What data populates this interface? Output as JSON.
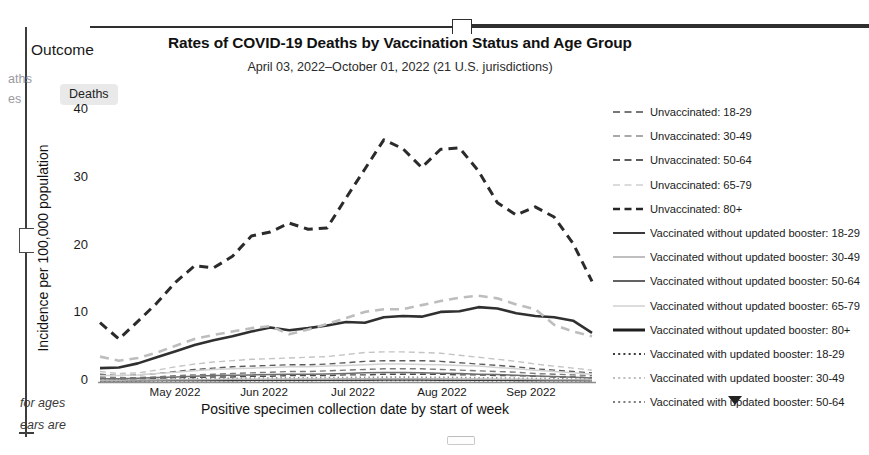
{
  "document": {
    "outcome_label": "Outcome",
    "gutter_fragment_1": "aths",
    "gutter_fragment_2": "es",
    "footnote_fragment_1": "for ages",
    "footnote_fragment_2": "ears are",
    "outcome_chip": "Deaths"
  },
  "chart_data": {
    "type": "line",
    "title": "Rates of COVID-19 Deaths by Vaccination Status and Age Group",
    "subtitle": "April 03, 2022–October 01, 2022 (21 U.S. jurisdictions)",
    "xlabel": "Positive specimen collection date by start of week",
    "ylabel": "Incidence per 100,000 population",
    "ylim": [
      0,
      40
    ],
    "yticks": [
      0,
      10,
      20,
      30,
      40
    ],
    "xticks": [
      "May 2022",
      "Jun 2022",
      "Jul 2022",
      "Aug 2022",
      "Sep 2022"
    ],
    "grid": false,
    "legend_position": "right",
    "x": [
      "2022-04-03",
      "2022-04-10",
      "2022-04-17",
      "2022-04-24",
      "2022-05-01",
      "2022-05-08",
      "2022-05-15",
      "2022-05-22",
      "2022-05-29",
      "2022-06-05",
      "2022-06-12",
      "2022-06-19",
      "2022-06-26",
      "2022-07-03",
      "2022-07-10",
      "2022-07-17",
      "2022-07-24",
      "2022-07-31",
      "2022-08-07",
      "2022-08-14",
      "2022-08-21",
      "2022-08-28",
      "2022-09-04",
      "2022-09-11",
      "2022-09-18",
      "2022-09-25",
      "2022-10-01"
    ],
    "series": [
      {
        "name": "Unvaccinated: 18-29",
        "style": "dashed",
        "color": "#4a4a4a",
        "width": 1.4,
        "values": [
          0.4,
          0.3,
          0.3,
          0.4,
          0.5,
          0.5,
          0.6,
          0.6,
          0.7,
          0.7,
          0.8,
          0.8,
          0.8,
          0.9,
          0.9,
          1.0,
          1.0,
          1.0,
          1.0,
          0.9,
          0.9,
          0.8,
          0.8,
          0.7,
          0.6,
          0.6,
          0.5
        ]
      },
      {
        "name": "Unvaccinated: 30-49",
        "style": "dashed",
        "color": "#7a7a7a",
        "width": 1.4,
        "values": [
          0.6,
          0.5,
          0.5,
          0.6,
          0.8,
          0.9,
          1.0,
          1.1,
          1.2,
          1.3,
          1.4,
          1.4,
          1.5,
          1.6,
          1.7,
          1.8,
          1.8,
          1.8,
          1.7,
          1.6,
          1.5,
          1.4,
          1.3,
          1.1,
          1.0,
          0.9,
          0.8
        ]
      },
      {
        "name": "Unvaccinated: 50-64",
        "style": "dashed",
        "color": "#5c5c5c",
        "width": 1.4,
        "values": [
          1.0,
          0.8,
          0.9,
          1.1,
          1.4,
          1.7,
          1.9,
          2.1,
          2.2,
          2.3,
          2.4,
          2.4,
          2.5,
          2.7,
          2.9,
          3.0,
          3.0,
          3.0,
          2.9,
          2.7,
          2.5,
          2.3,
          2.1,
          1.8,
          1.6,
          1.4,
          1.2
        ]
      },
      {
        "name": "Unvaccinated: 65-79",
        "style": "dashed",
        "color": "#c4c4c4",
        "width": 1.4,
        "values": [
          1.4,
          1.1,
          1.2,
          1.6,
          2.1,
          2.5,
          2.8,
          3.0,
          3.2,
          3.3,
          3.4,
          3.5,
          3.6,
          3.9,
          4.2,
          4.3,
          4.3,
          4.2,
          4.1,
          3.8,
          3.5,
          3.2,
          2.9,
          2.5,
          2.2,
          1.9,
          1.6
        ]
      },
      {
        "name": "Unvaccinated: 80+",
        "style": "dashed",
        "color": "#2b2b2b",
        "width": 3.0,
        "values": [
          8.6,
          6.2,
          8.8,
          11.5,
          14.6,
          17.0,
          16.7,
          18.4,
          21.4,
          22.0,
          23.3,
          22.4,
          22.6,
          27.0,
          31.3,
          35.6,
          34.3,
          31.5,
          34.2,
          34.4,
          31.0,
          26.3,
          24.5,
          25.7,
          24.2,
          20.3,
          14.7
        ]
      },
      {
        "name": "Vaccinated without updated booster: 18-29",
        "style": "solid",
        "color": "#3b3b3b",
        "width": 1.5,
        "values": [
          0.05,
          0.05,
          0.05,
          0.06,
          0.07,
          0.08,
          0.08,
          0.09,
          0.1,
          0.1,
          0.1,
          0.1,
          0.11,
          0.12,
          0.12,
          0.13,
          0.13,
          0.13,
          0.12,
          0.11,
          0.1,
          0.1,
          0.09,
          0.08,
          0.07,
          0.06,
          0.05
        ]
      },
      {
        "name": "Vaccinated without updated booster: 30-49",
        "style": "solid",
        "color": "#b5b5b5",
        "width": 1.5,
        "values": [
          0.12,
          0.12,
          0.13,
          0.15,
          0.18,
          0.2,
          0.22,
          0.24,
          0.26,
          0.27,
          0.28,
          0.29,
          0.3,
          0.32,
          0.34,
          0.35,
          0.35,
          0.34,
          0.33,
          0.31,
          0.29,
          0.27,
          0.25,
          0.22,
          0.2,
          0.18,
          0.15
        ]
      },
      {
        "name": "Vaccinated without updated booster: 50-64",
        "style": "solid",
        "color": "#6e6e6e",
        "width": 1.5,
        "values": [
          0.35,
          0.35,
          0.4,
          0.5,
          0.6,
          0.7,
          0.8,
          0.85,
          0.9,
          0.95,
          1.0,
          1.0,
          1.05,
          1.1,
          1.2,
          1.25,
          1.25,
          1.2,
          1.15,
          1.1,
          1.0,
          0.95,
          0.85,
          0.75,
          0.65,
          0.55,
          0.45
        ]
      },
      {
        "name": "Vaccinated without updated booster: 65-79",
        "style": "solid",
        "color": "#d2d2d2",
        "width": 1.5,
        "values": [
          0.8,
          0.8,
          0.9,
          1.1,
          1.3,
          1.5,
          1.7,
          1.8,
          1.9,
          2.0,
          2.1,
          2.1,
          2.2,
          2.3,
          2.4,
          2.5,
          2.5,
          2.45,
          2.4,
          2.3,
          2.2,
          2.0,
          1.8,
          1.6,
          1.4,
          1.2,
          1.0
        ]
      },
      {
        "name": "Vaccinated without updated booster: 80+",
        "style": "solid",
        "color": "#303030",
        "width": 2.6,
        "values": [
          1.9,
          2.0,
          2.6,
          3.5,
          4.4,
          5.3,
          6.0,
          6.6,
          7.3,
          7.9,
          7.5,
          7.8,
          8.2,
          8.7,
          8.6,
          9.4,
          9.6,
          9.5,
          10.2,
          10.3,
          10.9,
          10.7,
          10.0,
          9.6,
          9.4,
          8.9,
          7.1
        ]
      },
      {
        "name": "Vaccinated with updated booster: 18-29",
        "style": "dotted",
        "color": "#3b3b3b",
        "width": 1.6,
        "values": [
          0.03,
          0.03,
          0.03,
          0.04,
          0.04,
          0.05,
          0.05,
          0.05,
          0.06,
          0.06,
          0.06,
          0.06,
          0.07,
          0.07,
          0.07,
          0.08,
          0.08,
          0.08,
          0.07,
          0.07,
          0.06,
          0.06,
          0.05,
          0.05,
          0.04,
          0.04,
          0.03
        ]
      },
      {
        "name": "Vaccinated with updated booster: 30-49",
        "style": "dotted",
        "color": "#c0c0c0",
        "width": 1.6,
        "values": [
          0.08,
          0.08,
          0.09,
          0.1,
          0.11,
          0.12,
          0.13,
          0.14,
          0.15,
          0.16,
          0.16,
          0.17,
          0.17,
          0.18,
          0.19,
          0.19,
          0.19,
          0.19,
          0.18,
          0.17,
          0.16,
          0.15,
          0.14,
          0.12,
          0.11,
          0.1,
          0.08
        ]
      },
      {
        "name": "Vaccinated with updated booster: 50-64",
        "style": "dotted",
        "color": "#8a8a8a",
        "width": 1.6,
        "values": [
          0.2,
          0.2,
          0.22,
          0.26,
          0.3,
          0.34,
          0.38,
          0.4,
          0.43,
          0.45,
          0.47,
          0.48,
          0.5,
          0.52,
          0.55,
          0.57,
          0.57,
          0.56,
          0.54,
          0.52,
          0.49,
          0.46,
          0.42,
          0.38,
          0.34,
          0.3,
          0.25
        ]
      }
    ],
    "unvaccinated_80plus_dashed_overlay": {
      "name": "Unvaccinated: 65-79 (dashed, light) upper band",
      "style": "dashed",
      "color": "#bdbdbd",
      "width": 2.6,
      "values": [
        3.6,
        3.0,
        3.4,
        4.2,
        5.2,
        6.2,
        6.8,
        7.3,
        7.8,
        8.1,
        6.9,
        7.6,
        8.4,
        9.3,
        10.2,
        10.6,
        10.6,
        11.2,
        11.8,
        12.3,
        12.6,
        12.2,
        11.3,
        10.6,
        8.3,
        7.3,
        6.6
      ]
    }
  },
  "legend": {
    "more_icon": "chevron-down-icon",
    "entries": [
      {
        "label": "Unvaccinated: 18-29",
        "style": "dashed",
        "color": "#4a4a4a",
        "width": 1.6
      },
      {
        "label": "Unvaccinated: 30-49",
        "style": "dashed",
        "color": "#8d8d8d",
        "width": 1.6
      },
      {
        "label": "Unvaccinated: 50-64",
        "style": "dashed",
        "color": "#5c5c5c",
        "width": 1.8
      },
      {
        "label": "Unvaccinated: 65-79",
        "style": "dashed",
        "color": "#cfcfcf",
        "width": 1.6
      },
      {
        "label": "Unvaccinated: 80+",
        "style": "dashed",
        "color": "#262626",
        "width": 2.6
      },
      {
        "label": "Vaccinated without updated booster: 18-29",
        "style": "solid",
        "color": "#2e2e2e",
        "width": 1.9
      },
      {
        "label": "Vaccinated without updated booster: 30-49",
        "style": "solid",
        "color": "#b0b0b0",
        "width": 1.6
      },
      {
        "label": "Vaccinated without updated booster: 50-64",
        "style": "solid",
        "color": "#5a5a5a",
        "width": 1.9
      },
      {
        "label": "Vaccinated without updated booster: 65-79",
        "style": "solid",
        "color": "#d4d4d4",
        "width": 1.6
      },
      {
        "label": "Vaccinated without updated booster: 80+",
        "style": "solid",
        "color": "#1f1f1f",
        "width": 3.0
      },
      {
        "label": "Vaccinated with updated booster: 18-29",
        "style": "dotted",
        "color": "#3a3a3a",
        "width": 2.0
      },
      {
        "label": "Vaccinated with updated booster: 30-49",
        "style": "dotted",
        "color": "#bdbdbd",
        "width": 2.0
      },
      {
        "label": "Vaccinated with updated booster: 50-64",
        "style": "dotted",
        "color": "#7d7d7d",
        "width": 2.0
      }
    ]
  }
}
